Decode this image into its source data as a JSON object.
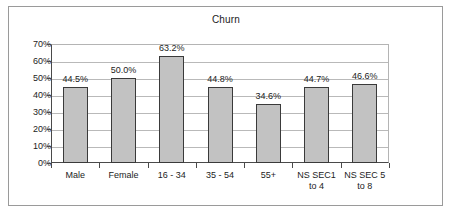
{
  "chart_data": {
    "type": "bar",
    "title": "Churn",
    "xlabel": "",
    "ylabel": "",
    "ylim": [
      0,
      70
    ],
    "ytick_labels": [
      "70%",
      "60%",
      "50%",
      "40%",
      "30%",
      "20%",
      "10%",
      "0%"
    ],
    "ytick_values": [
      70,
      60,
      50,
      40,
      30,
      20,
      10,
      0
    ],
    "grid": true,
    "legend": false,
    "categories": [
      "Male",
      "Female",
      "16 - 34",
      "35 - 54",
      "55+",
      "NS SEC1 to 4",
      "NS SEC 5 to 8"
    ],
    "category_lines": [
      [
        "Male"
      ],
      [
        "Female"
      ],
      [
        "16 - 34"
      ],
      [
        "35 - 54"
      ],
      [
        "55+"
      ],
      [
        "NS SEC1",
        "to 4"
      ],
      [
        "NS SEC 5",
        "to 8"
      ]
    ],
    "values": [
      44.5,
      50.0,
      63.2,
      44.8,
      34.6,
      44.7,
      46.6
    ],
    "data_labels": [
      "44.5%",
      "50.0%",
      "63.2%",
      "44.8%",
      "34.6%",
      "44.7%",
      "46.6%"
    ],
    "colors": {
      "bar_fill": "#c2c2c2",
      "bar_border": "#3a3a3a",
      "gridline": "#b9b9b9",
      "axis": "#4a4a4a",
      "text": "#1c1c1c",
      "frame": "#9a9a9a",
      "background": "#ffffff"
    }
  }
}
